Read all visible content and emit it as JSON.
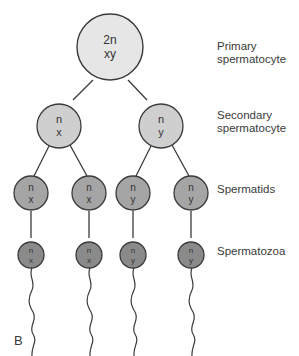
{
  "diagram": {
    "panel_letter": "B",
    "stages": [
      {
        "id": "primary",
        "label_line1": "Primary",
        "label_line2": "spermatocyte",
        "fill": "#e6e6e6"
      },
      {
        "id": "secondary",
        "label_line1": "Secondary",
        "label_line2": "spermatocyte",
        "fill": "#cfcfcf"
      },
      {
        "id": "spermatids",
        "label_line1": "Spermatids",
        "fill": "#a5a5a5"
      },
      {
        "id": "spermatozoa",
        "label_line1": "Spermatozoa",
        "fill": "#8a8a8a"
      }
    ],
    "cells": {
      "primary": {
        "ploidy": "2n",
        "chromosomes": "xy"
      },
      "secondary": [
        {
          "ploidy": "n",
          "chromosomes": "x"
        },
        {
          "ploidy": "n",
          "chromosomes": "y"
        }
      ],
      "spermatids": [
        {
          "ploidy": "n",
          "chromosomes": "x"
        },
        {
          "ploidy": "n",
          "chromosomes": "x"
        },
        {
          "ploidy": "n",
          "chromosomes": "y"
        },
        {
          "ploidy": "n",
          "chromosomes": "y"
        }
      ],
      "spermatozoa": [
        {
          "ploidy": "n",
          "chromosomes": "x"
        },
        {
          "ploidy": "n",
          "chromosomes": "x"
        },
        {
          "ploidy": "n",
          "chromosomes": "y"
        },
        {
          "ploidy": "n",
          "chromosomes": "y"
        }
      ]
    },
    "colors": {
      "stroke": "#3a3a3a",
      "text": "#333333"
    }
  }
}
